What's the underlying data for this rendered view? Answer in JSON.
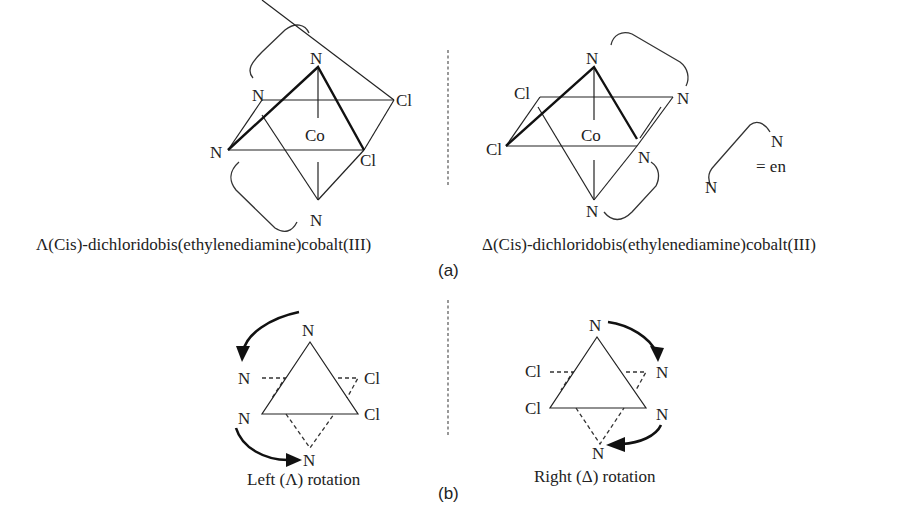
{
  "figure": {
    "panel_a": {
      "label": "(a)",
      "lambda_isomer": {
        "caption": "Λ(Cis)-dichloridobis(ethylenediamine)cobalt(III)",
        "center_atom": "Co",
        "atoms": {
          "top": "N",
          "upper_left": "N",
          "left": "N",
          "bottom": "N",
          "upper_right": "Cl",
          "lower_right": "Cl"
        }
      },
      "delta_isomer": {
        "caption": "Δ(Cis)-dichloridobis(ethylenediamine)cobalt(III)",
        "center_atom": "Co",
        "atoms": {
          "top": "N",
          "upper_left": "Cl",
          "left": "Cl",
          "upper_right": "N",
          "lower_right": "N",
          "bottom": "N"
        }
      },
      "legend": {
        "atom_top": "N",
        "atom_bottom": "N",
        "equals_text": "= en"
      }
    },
    "panel_b": {
      "label": "(b)",
      "left_rotation": {
        "caption": "Left (Λ) rotation",
        "atoms": {
          "top": "N",
          "upper_left": "N",
          "lower_left": "N",
          "bottom": "N",
          "upper_right": "Cl",
          "lower_right": "Cl"
        }
      },
      "right_rotation": {
        "caption": "Right (Δ) rotation",
        "atoms": {
          "top": "N",
          "upper_left": "Cl",
          "lower_left": "Cl",
          "upper_right": "N",
          "lower_right": "N",
          "bottom": "N"
        }
      }
    }
  }
}
